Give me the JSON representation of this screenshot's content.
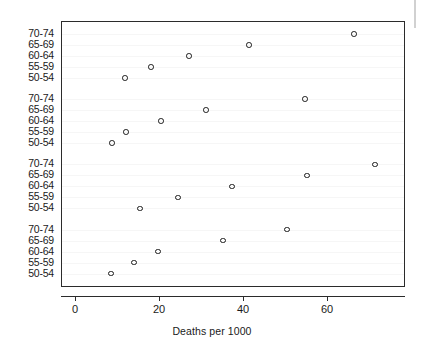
{
  "chart_data": {
    "type": "scatter",
    "title": "",
    "subtitle": "",
    "xlabel": "Deaths per 1000",
    "ylabel": "",
    "xlim": [
      -3,
      79
    ],
    "ylim_categories": 20,
    "grid": false,
    "legend": null,
    "marker": "open-circle",
    "x_ticks": [
      0,
      20,
      40,
      60
    ],
    "x_tick_labels": [
      "0",
      "20",
      "40",
      "60"
    ],
    "y_tick_labels": [
      "70-74",
      "65-69",
      "60-64",
      "55-59",
      "50-54",
      "70-74",
      "65-69",
      "60-64",
      "55-59",
      "50-54",
      "70-74",
      "65-69",
      "60-64",
      "55-59",
      "50-54",
      "70-74",
      "65-69",
      "60-64",
      "55-59",
      "50-54"
    ],
    "groups": [
      {
        "index": 1,
        "categories": [
          "70-74",
          "65-69",
          "60-64",
          "55-59",
          "50-54"
        ],
        "values": [
          66.2,
          41.2,
          26.9,
          17.9,
          11.7
        ]
      },
      {
        "index": 2,
        "categories": [
          "70-74",
          "65-69",
          "60-64",
          "55-59",
          "50-54"
        ],
        "values": [
          54.5,
          31.0,
          20.2,
          11.9,
          8.6
        ]
      },
      {
        "index": 3,
        "categories": [
          "70-74",
          "65-69",
          "60-64",
          "55-59",
          "50-54"
        ],
        "values": [
          71.2,
          55.0,
          37.1,
          24.3,
          15.2
        ]
      },
      {
        "index": 4,
        "categories": [
          "70-74",
          "65-69",
          "60-64",
          "55-59",
          "50-54"
        ],
        "values": [
          50.2,
          35.0,
          19.5,
          13.8,
          8.3
        ]
      }
    ],
    "points": [
      {
        "group": 1,
        "category": "70-74",
        "x": 66.2,
        "row": 0
      },
      {
        "group": 1,
        "category": "65-69",
        "x": 41.2,
        "row": 1
      },
      {
        "group": 1,
        "category": "60-64",
        "x": 26.9,
        "row": 2
      },
      {
        "group": 1,
        "category": "55-59",
        "x": 17.9,
        "row": 3
      },
      {
        "group": 1,
        "category": "50-54",
        "x": 11.7,
        "row": 4
      },
      {
        "group": 2,
        "category": "70-74",
        "x": 54.5,
        "row": 5
      },
      {
        "group": 2,
        "category": "65-69",
        "x": 31.0,
        "row": 6
      },
      {
        "group": 2,
        "category": "60-64",
        "x": 20.2,
        "row": 7
      },
      {
        "group": 2,
        "category": "55-59",
        "x": 11.9,
        "row": 8
      },
      {
        "group": 2,
        "category": "50-54",
        "x": 8.6,
        "row": 9
      },
      {
        "group": 3,
        "category": "70-74",
        "x": 71.2,
        "row": 10
      },
      {
        "group": 3,
        "category": "65-69",
        "x": 55.0,
        "row": 11
      },
      {
        "group": 3,
        "category": "60-64",
        "x": 37.1,
        "row": 12
      },
      {
        "group": 3,
        "category": "55-59",
        "x": 24.3,
        "row": 13
      },
      {
        "group": 3,
        "category": "50-54",
        "x": 15.2,
        "row": 14
      },
      {
        "group": 4,
        "category": "70-74",
        "x": 50.2,
        "row": 15
      },
      {
        "group": 4,
        "category": "65-69",
        "x": 35.0,
        "row": 16
      },
      {
        "group": 4,
        "category": "60-64",
        "x": 19.5,
        "row": 17
      },
      {
        "group": 4,
        "category": "55-59",
        "x": 13.8,
        "row": 18
      },
      {
        "group": 4,
        "category": "50-54",
        "x": 8.3,
        "row": 19
      }
    ],
    "colors": {
      "axis": "#2b2b2b",
      "marker_stroke": "#1c1c1c",
      "text": "#1a1a1a",
      "background": "#ffffff"
    }
  }
}
